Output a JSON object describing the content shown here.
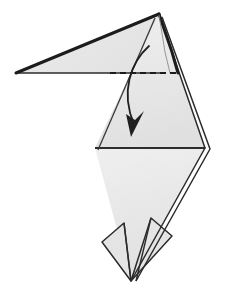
{
  "figure": {
    "type": "origami-instruction-diagram",
    "width": 230,
    "height": 291,
    "background_color": "#ffffff"
  },
  "style": {
    "paper_fill": "#e9e9e9",
    "paper_fill_light": "#efefef",
    "paper_fill_shadow": "#e2e2e2",
    "edge_color": "#2b2b2b",
    "edge_color_soft": "#4a4a4a",
    "thick_edge_color": "#1c1c1c",
    "dash_color": "#1c1c1c",
    "arrow_color": "#1f1f1f",
    "edge_width": "1.4",
    "thick_edge_width": "2.6",
    "dash_pattern": "6 4",
    "arrow_width": "1.8"
  },
  "shapes": {
    "upper_flap": {
      "name": "upper-left-pointed-flap",
      "points": "16,73 159,14 150,73",
      "fill": "#ececec"
    },
    "upper_flap_top_edge": {
      "name": "flap-top-thick-edge",
      "points": "16,73 159,14"
    },
    "upper_flap_bottom_edge": {
      "name": "flap-bottom-edge",
      "points": "16,73 163,73"
    },
    "kite_upper": {
      "name": "upper-kite-body",
      "points": "159,14 205,148 95,148",
      "fill": "#e9e9e9"
    },
    "kite_lower": {
      "name": "lower-kite-body",
      "points": "95,148 205,148 131,281",
      "fill": "#e9e9e9"
    },
    "left_flap": {
      "name": "lower-left-side-flap",
      "points": "102,242 124,223 131,281",
      "fill": "#e4e4e4"
    },
    "right_flap": {
      "name": "lower-right-side-flap",
      "points": "172,236 151,218 131,281",
      "fill": "#e4e4e4"
    },
    "right_layer_edge": {
      "name": "right-double-layer-edge",
      "points": "162,17 210,149 136,281"
    },
    "apex_inner_edge": {
      "name": "apex-inner-layer-edge",
      "points": "155,18 98,150"
    },
    "waist_line": {
      "name": "waist-horizontal-crease",
      "points": "95,148 205,148"
    }
  },
  "fold_line": {
    "name": "valley-fold-dashed-line",
    "label": "valley fold",
    "from_x": 110,
    "to_x": 178,
    "y": 73
  },
  "fold_arrow": {
    "name": "fold-direction-arrow",
    "label": "fold down",
    "path": "M 149,46 C 131,62 120,92 134,124",
    "head": "131,137 126,114 135,120 144,111",
    "tip_x": 133,
    "tip_y": 136
  }
}
